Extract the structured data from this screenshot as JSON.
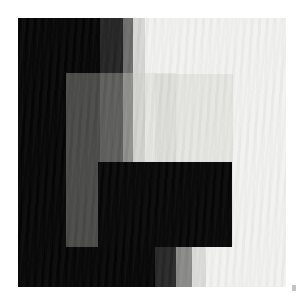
{
  "artwork": {
    "title": "Untitled grayscale field composition",
    "medium": "abstract geometric tonal study",
    "canvas": {
      "width": 304,
      "height": 304,
      "units": "px"
    },
    "paper_color": "#ffffff",
    "plate": {
      "left": 18,
      "top": 18,
      "width": 268,
      "height": 269
    }
  },
  "palette": {
    "black": "#050505",
    "near_black": "#0a0a0a",
    "dark_gray": "#2e2e2e",
    "mid_dark_gray": "#4a4a4a",
    "mid_gray": "#8e8e8e",
    "light_gray": "#c9c9c7",
    "pale": "#e8e8e6",
    "off_white": "#f4f4f2",
    "white": "#ffffff",
    "overlay_wash": "rgba(205,205,200,0.34)"
  },
  "bands_upper": [
    {
      "name": "band-black",
      "x": 0,
      "width": 82,
      "color": "#050505"
    },
    {
      "name": "band-dark-gray",
      "x": 82,
      "width": 23,
      "color": "#242424"
    },
    {
      "name": "band-mid-gray",
      "x": 105,
      "width": 10,
      "color": "#6e6e6e"
    },
    {
      "name": "band-light-gray",
      "x": 115,
      "width": 12,
      "color": "#d6d6d4"
    },
    {
      "name": "band-off-white",
      "x": 127,
      "width": 141,
      "color": "#f2f2f0"
    }
  ],
  "bands_lower": [
    {
      "name": "band-lower-black",
      "x": 0,
      "width": 137,
      "color": "#050505"
    },
    {
      "name": "band-lower-dark-gray",
      "x": 137,
      "width": 21,
      "color": "#272727"
    },
    {
      "name": "band-lower-mid-gray",
      "x": 158,
      "width": 16,
      "color": "#8a8a88"
    },
    {
      "name": "band-lower-light-gray",
      "x": 174,
      "width": 14,
      "color": "#dcdcda"
    },
    {
      "name": "band-lower-off-white",
      "x": 188,
      "width": 80,
      "color": "#f2f2f0"
    }
  ],
  "lower_step": {
    "top": 229,
    "height": 40
  },
  "overlays": [
    {
      "name": "overlay-rect-left",
      "x": 48,
      "y": 55,
      "width": 110,
      "height": 174
    },
    {
      "name": "overlay-rect-right",
      "x": 137,
      "y": 56,
      "width": 78,
      "height": 172
    }
  ],
  "center_block": {
    "name": "center-block",
    "x": 80,
    "y": 144,
    "width": 134,
    "height": 85,
    "color": "#060606"
  },
  "artifacts": [
    {
      "name": "dust-speck",
      "x": 292,
      "y": 285,
      "width": 4,
      "height": 6,
      "color": "#b9b9b9"
    }
  ],
  "texture": {
    "name": "diagonal-moire",
    "angle_deg": 96,
    "opacity": 0.55,
    "description": "fine diagonal scan moire across the whole plate"
  },
  "caption": "Abstract grayscale composition: stacked vertical tonal bands with translucent rectangular washes and a solid black central block."
}
